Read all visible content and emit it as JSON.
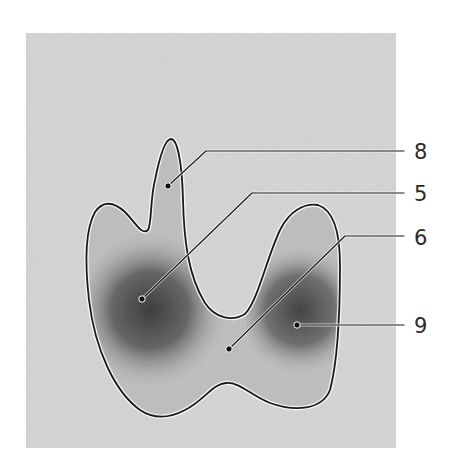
{
  "figure": {
    "type": "anatomical-schematic",
    "background_color": "#ffffff",
    "panel_color": "#d9d9d9",
    "outline_color": "#1a1a1a",
    "shading_dark": "#4a4a4a"
  },
  "labels": [
    {
      "id": "8",
      "text": "8",
      "x": 414,
      "y": 142,
      "dot": [
        168,
        186
      ],
      "elbow": [
        206,
        151
      ],
      "line_y": 151
    },
    {
      "id": "5",
      "text": "5",
      "x": 414,
      "y": 184,
      "dot": [
        142,
        299
      ],
      "elbow": [
        252,
        193
      ],
      "line_y": 193
    },
    {
      "id": "6",
      "text": "6",
      "x": 414,
      "y": 228,
      "dot": [
        229,
        349
      ],
      "elbow": [
        345,
        236
      ],
      "line_y": 236
    },
    {
      "id": "9",
      "text": "9",
      "x": 414,
      "y": 316,
      "dot": [
        297,
        325
      ],
      "elbow": [
        297,
        325
      ],
      "line_y": 325
    }
  ]
}
